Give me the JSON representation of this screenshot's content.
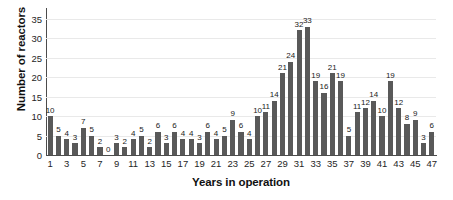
{
  "chart_data": {
    "type": "bar",
    "title": "",
    "xlabel": "Years in operation",
    "ylabel": "Number of reactors",
    "xlim": [
      0,
      48
    ],
    "ylim": [
      0,
      37
    ],
    "grid": true,
    "legend": "none",
    "bar_color": "#595959",
    "axis_color": "#4c4c4c",
    "grid_color": "#e9e9e9",
    "background": "#ffffff",
    "y_ticks": [
      0,
      5,
      10,
      15,
      20,
      25,
      30,
      35
    ],
    "x_ticks": [
      1,
      3,
      5,
      7,
      9,
      11,
      13,
      15,
      17,
      19,
      21,
      23,
      25,
      27,
      29,
      31,
      33,
      35,
      37,
      39,
      41,
      43,
      45,
      47
    ],
    "categories": [
      1,
      2,
      3,
      4,
      5,
      6,
      7,
      8,
      9,
      10,
      11,
      12,
      13,
      14,
      15,
      16,
      17,
      18,
      19,
      20,
      21,
      22,
      23,
      24,
      25,
      26,
      27,
      28,
      29,
      30,
      31,
      32,
      33,
      34,
      35,
      36,
      37,
      38,
      39,
      40,
      41,
      42,
      43,
      44,
      45,
      46,
      47
    ],
    "values": [
      10,
      5,
      4,
      3,
      7,
      5,
      2,
      0,
      3,
      2,
      4,
      5,
      2,
      6,
      3,
      6,
      4,
      4,
      3,
      6,
      4,
      5,
      9,
      6,
      4,
      10,
      11,
      14,
      21,
      24,
      32,
      33,
      19,
      16,
      21,
      19,
      5,
      11,
      12,
      14,
      10,
      19,
      12,
      8,
      9,
      3,
      6
    ],
    "data_labels": [
      "10",
      "5",
      "4",
      "3",
      "7",
      "5",
      "2",
      "0",
      "3",
      "2",
      "4",
      "5",
      "2",
      "6",
      "3",
      "6",
      "4",
      "4",
      "3",
      "6",
      "4",
      "5",
      "9",
      "6",
      "4",
      "10",
      "11",
      "14",
      "21",
      "24",
      "32",
      "33",
      "19",
      "16",
      "21",
      "19",
      "5",
      "11",
      "12",
      "14",
      "10",
      "19",
      "12",
      "8",
      "9",
      "3",
      "6"
    ]
  }
}
